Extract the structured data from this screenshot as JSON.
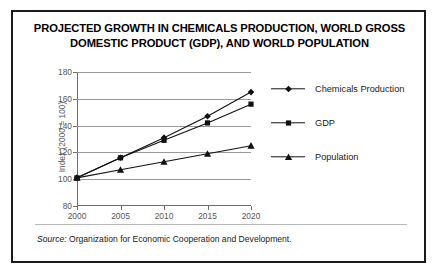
{
  "figure": {
    "title": "PROJECTED GROWTH IN CHEMICALS PRODUCTION, WORLD GROSS DOMESTIC PRODUCT (GDP), AND WORLD POPULATION",
    "title_line1": "PROJECTED GROWTH IN CHEMICALS PRODUCTION, WORLD GROSS",
    "title_line2": "DOMESTIC PRODUCT (GDP), AND WORLD POPULATION",
    "source_prefix": "Source:",
    "source_text": "Organization for Economic Cooperation and Development.",
    "border_color": "#1a1a1a",
    "background_color": "#ffffff"
  },
  "chart_data": {
    "type": "line",
    "title": "PROJECTED GROWTH IN CHEMICALS PRODUCTION, WORLD GROSS DOMESTIC PRODUCT (GDP), AND WORLD POPULATION",
    "xlabel": "",
    "ylabel": "Index (2000 = 100)",
    "categories": [
      "2000",
      "2005",
      "2010",
      "2015",
      "2020"
    ],
    "x": [
      2000,
      2005,
      2010,
      2015,
      2020
    ],
    "series": [
      {
        "name": "Chemicals Production",
        "marker": "diamond",
        "color": "#111111",
        "values": [
          101,
          116,
          131,
          147,
          165
        ]
      },
      {
        "name": "GDP",
        "marker": "square",
        "color": "#111111",
        "values": [
          101,
          116,
          129,
          142,
          156
        ]
      },
      {
        "name": "Population",
        "marker": "triangle",
        "color": "#111111",
        "values": [
          101,
          107,
          113,
          119,
          125
        ]
      }
    ],
    "ylim": [
      80,
      180
    ],
    "yticks": [
      80,
      100,
      120,
      140,
      160,
      180
    ],
    "ytick_labels": [
      "80",
      "100",
      "120",
      "140",
      "160",
      "180"
    ],
    "xlim": [
      2000,
      2020
    ],
    "xticks": [
      2000,
      2005,
      2010,
      2015,
      2020
    ],
    "xtick_labels": [
      "2000",
      "2005",
      "2010",
      "2015",
      "2020"
    ],
    "grid": "horizontal",
    "grid_color": "#9a9a9a",
    "legend_position": "right"
  }
}
